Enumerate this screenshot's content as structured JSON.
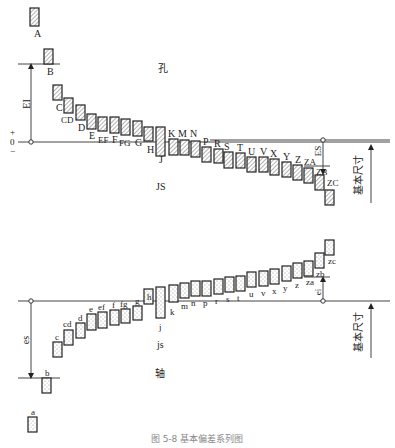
{
  "diagram": {
    "title_holes": "孔",
    "title_shafts": "轴",
    "caption": "图 5-8 基本偏差系列图",
    "zero_line_label": {
      "plus": "+",
      "zero": "0",
      "minus": "−"
    },
    "basic_size_label": "基本尺寸",
    "hole_annotations": {
      "EI": "EI",
      "ES": "ES",
      "JS": "JS"
    },
    "shaft_annotations": {
      "es": "es",
      "ei": "ei",
      "js": "js"
    },
    "holes": [
      {
        "label": "A",
        "x": 30,
        "top": 8,
        "bottom": 26,
        "lx": 34,
        "ly": 37
      },
      {
        "label": "B",
        "x": 44,
        "top": 49,
        "bottom": 64,
        "lx": 47,
        "ly": 75
      },
      {
        "label": "C",
        "x": 53,
        "top": 85,
        "bottom": 100,
        "lx": 56,
        "ly": 111
      },
      {
        "label": "CD",
        "x": 64,
        "top": 98,
        "bottom": 113,
        "lx": 61,
        "ly": 123
      },
      {
        "label": "D",
        "x": 76,
        "top": 105,
        "bottom": 120,
        "lx": 78,
        "ly": 131
      },
      {
        "label": "E",
        "x": 87,
        "top": 114,
        "bottom": 129,
        "lx": 89,
        "ly": 139
      },
      {
        "label": "EF",
        "x": 98,
        "top": 117,
        "bottom": 131,
        "lx": 98,
        "ly": 143
      },
      {
        "label": "F",
        "x": 110,
        "top": 117,
        "bottom": 133,
        "lx": 112,
        "ly": 143
      },
      {
        "label": "FG",
        "x": 121,
        "top": 119,
        "bottom": 135,
        "lx": 119,
        "ly": 146
      },
      {
        "label": "G",
        "x": 133,
        "top": 121,
        "bottom": 136,
        "lx": 135,
        "ly": 146
      },
      {
        "label": "H",
        "x": 144,
        "top": 127,
        "bottom": 141,
        "lx": 147,
        "ly": 153
      },
      {
        "label": "J",
        "x": 156,
        "top": 127,
        "bottom": 156,
        "lx": 159,
        "ly": 163
      },
      {
        "label": "K",
        "x": 169,
        "top": 139,
        "bottom": 155,
        "lx": 168,
        "ly": 137
      },
      {
        "label": "M",
        "x": 180,
        "top": 140,
        "bottom": 155,
        "lx": 178,
        "ly": 137
      },
      {
        "label": "N",
        "x": 191,
        "top": 141,
        "bottom": 157,
        "lx": 190,
        "ly": 137
      },
      {
        "label": "P",
        "x": 202,
        "top": 147,
        "bottom": 162,
        "lx": 203,
        "ly": 145
      },
      {
        "label": "R",
        "x": 214,
        "top": 149,
        "bottom": 163,
        "lx": 214,
        "ly": 147
      },
      {
        "label": "S",
        "x": 224,
        "top": 152,
        "bottom": 168,
        "lx": 224,
        "ly": 150
      },
      {
        "label": "T",
        "x": 236,
        "top": 153,
        "bottom": 168,
        "lx": 237,
        "ly": 151
      },
      {
        "label": "U",
        "x": 247,
        "top": 157,
        "bottom": 172,
        "lx": 248,
        "ly": 155
      },
      {
        "label": "V",
        "x": 259,
        "top": 157,
        "bottom": 172,
        "lx": 260,
        "ly": 155
      },
      {
        "label": "X",
        "x": 270,
        "top": 159,
        "bottom": 175,
        "lx": 270,
        "ly": 157
      },
      {
        "label": "Y",
        "x": 282,
        "top": 162,
        "bottom": 177,
        "lx": 283,
        "ly": 160
      },
      {
        "label": "Z",
        "x": 293,
        "top": 165,
        "bottom": 180,
        "lx": 295,
        "ly": 163
      },
      {
        "label": "ZA",
        "x": 304,
        "top": 168,
        "bottom": 183,
        "lx": 304,
        "ly": 165
      },
      {
        "label": "ZB",
        "x": 315,
        "top": 175,
        "bottom": 190,
        "lx": 316,
        "ly": 175
      },
      {
        "label": "ZC",
        "x": 325,
        "top": 190,
        "bottom": 205,
        "lx": 327,
        "ly": 186
      }
    ],
    "shafts": [
      {
        "label": "a",
        "x": 28,
        "top": 417,
        "bottom": 432,
        "lx": 31,
        "ly": 415
      },
      {
        "label": "b",
        "x": 42,
        "top": 378,
        "bottom": 393,
        "lx": 45,
        "ly": 376
      },
      {
        "label": "c",
        "x": 53,
        "top": 342,
        "bottom": 357,
        "lx": 55,
        "ly": 340
      },
      {
        "label": "cd",
        "x": 64,
        "top": 330,
        "bottom": 345,
        "lx": 63,
        "ly": 327
      },
      {
        "label": "d",
        "x": 76,
        "top": 323,
        "bottom": 338,
        "lx": 78,
        "ly": 321
      },
      {
        "label": "e",
        "x": 87,
        "top": 314,
        "bottom": 330,
        "lx": 89,
        "ly": 312
      },
      {
        "label": "ef",
        "x": 98,
        "top": 312,
        "bottom": 328,
        "lx": 98,
        "ly": 310
      },
      {
        "label": "f",
        "x": 110,
        "top": 310,
        "bottom": 325,
        "lx": 112,
        "ly": 308
      },
      {
        "label": "fg",
        "x": 121,
        "top": 309,
        "bottom": 323,
        "lx": 120,
        "ly": 307
      },
      {
        "label": "g",
        "x": 133,
        "top": 306,
        "bottom": 320,
        "lx": 135,
        "ly": 304
      },
      {
        "label": "h",
        "x": 144,
        "top": 302,
        "bottom": 302,
        "lx": 147,
        "ly": 300
      },
      {
        "label": "j",
        "x": 156,
        "top": 287,
        "bottom": 318,
        "lx": 159,
        "ly": 330
      },
      {
        "label": "k",
        "x": 169,
        "top": 285,
        "bottom": 302,
        "lx": 170,
        "ly": 315
      },
      {
        "label": "m",
        "x": 180,
        "top": 283,
        "bottom": 298,
        "lx": 181,
        "ly": 309
      },
      {
        "label": "n",
        "x": 191,
        "top": 281,
        "bottom": 296,
        "lx": 191,
        "ly": 306
      },
      {
        "label": "p",
        "x": 202,
        "top": 281,
        "bottom": 296,
        "lx": 203,
        "ly": 306
      },
      {
        "label": "r",
        "x": 214,
        "top": 279,
        "bottom": 294,
        "lx": 215,
        "ly": 304
      },
      {
        "label": "s",
        "x": 225,
        "top": 277,
        "bottom": 292,
        "lx": 226,
        "ly": 302
      },
      {
        "label": "t",
        "x": 236,
        "top": 276,
        "bottom": 291,
        "lx": 237,
        "ly": 301
      },
      {
        "label": "u",
        "x": 247,
        "top": 272,
        "bottom": 287,
        "lx": 249,
        "ly": 297
      },
      {
        "label": "v",
        "x": 259,
        "top": 271,
        "bottom": 286,
        "lx": 261,
        "ly": 296
      },
      {
        "label": "x",
        "x": 270,
        "top": 269,
        "bottom": 284,
        "lx": 272,
        "ly": 294
      },
      {
        "label": "y",
        "x": 282,
        "top": 266,
        "bottom": 281,
        "lx": 283,
        "ly": 291
      },
      {
        "label": "z",
        "x": 293,
        "top": 263,
        "bottom": 278,
        "lx": 295,
        "ly": 288
      },
      {
        "label": "za",
        "x": 304,
        "top": 261,
        "bottom": 276,
        "lx": 306,
        "ly": 285
      },
      {
        "label": "zb",
        "x": 315,
        "top": 253,
        "bottom": 268,
        "lx": 316,
        "ly": 277
      },
      {
        "label": "zc",
        "x": 325,
        "top": 240,
        "bottom": 255,
        "lx": 328,
        "ly": 264
      }
    ]
  }
}
